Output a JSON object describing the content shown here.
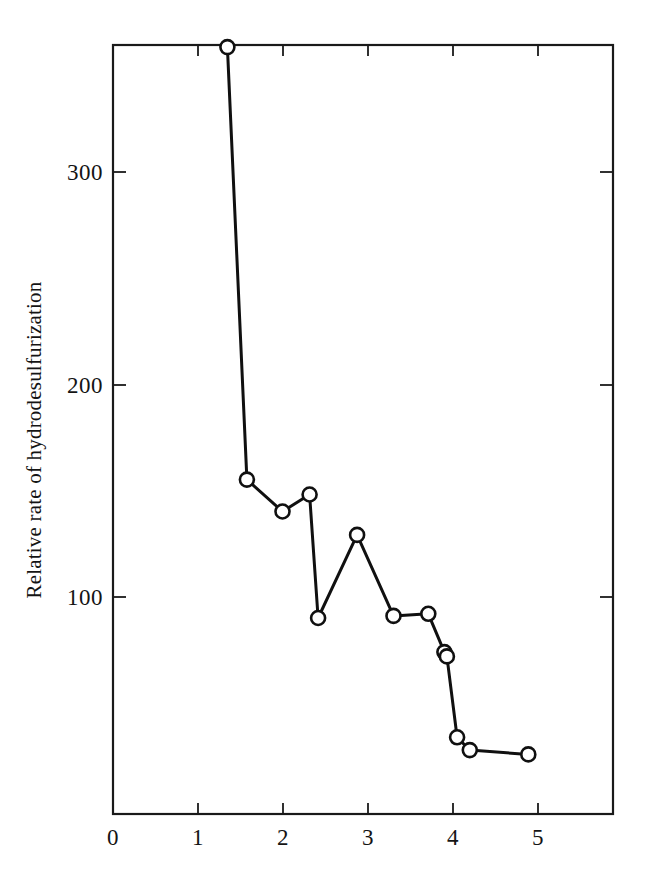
{
  "chart_data": {
    "type": "line",
    "title": "",
    "xlabel": "",
    "ylabel": "Relative rate of hydrodesulfurization",
    "xlim": [
      0,
      5.9
    ],
    "ylim": [
      0,
      361
    ],
    "grid": false,
    "legend": "none",
    "marker": "open-circle",
    "line_color": "#101010",
    "marker_fill": "#ffffff",
    "xticks": [
      0,
      1,
      2,
      3,
      4,
      5
    ],
    "xtick_labels": [
      "0",
      "1",
      "2",
      "3",
      "4",
      "5"
    ],
    "yticks": [
      100,
      200,
      300
    ],
    "ytick_labels": [
      "100",
      "200",
      "300"
    ],
    "series": [
      {
        "name": "Relative rate of hydrodesulfurization",
        "x": [
          1.35,
          1.58,
          2.0,
          2.32,
          2.42,
          2.88,
          3.31,
          3.72,
          3.91,
          3.94,
          4.06,
          4.21,
          4.9
        ],
        "y": [
          360,
          157,
          142,
          150,
          92,
          131,
          93,
          94,
          76,
          74,
          36,
          30,
          28
        ]
      }
    ]
  },
  "axis": {
    "y_title": "Relative rate of hydrodesulfurization",
    "x_tick_0": "0",
    "x_tick_1": "1",
    "x_tick_2": "2",
    "x_tick_3": "3",
    "x_tick_4": "4",
    "x_tick_5": "5",
    "y_tick_100": "100",
    "y_tick_200": "200",
    "y_tick_300": "300"
  }
}
